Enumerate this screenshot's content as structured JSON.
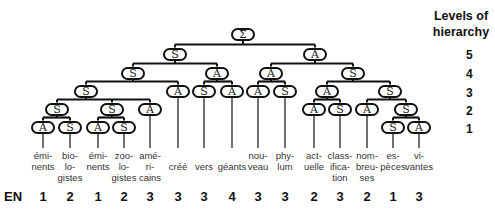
{
  "header": {
    "line1": "Levels of",
    "line2": "hierarchy"
  },
  "levels": [
    {
      "label": "5",
      "y": 48
    },
    {
      "label": "4",
      "y": 67
    },
    {
      "label": "3",
      "y": 86
    },
    {
      "label": "2",
      "y": 104
    },
    {
      "label": "1",
      "y": 122
    }
  ],
  "en_label": "EN",
  "nodes": [
    {
      "id": "root",
      "label": "Σ",
      "x": 243,
      "y": 34,
      "parent": null
    },
    {
      "id": "s5",
      "label": "S",
      "x": 175,
      "y": 54,
      "parent": "root"
    },
    {
      "id": "a5",
      "label": "A",
      "x": 315,
      "y": 54,
      "parent": "root"
    },
    {
      "id": "s4",
      "label": "S",
      "x": 133,
      "y": 73,
      "parent": "s5"
    },
    {
      "id": "a4a",
      "label": "A",
      "x": 217,
      "y": 73,
      "parent": "s5"
    },
    {
      "id": "a4b",
      "label": "A",
      "x": 271,
      "y": 73,
      "parent": "a5"
    },
    {
      "id": "s4b",
      "label": "S",
      "x": 353,
      "y": 73,
      "parent": "a5"
    },
    {
      "id": "s3",
      "label": "S",
      "x": 86,
      "y": 91,
      "parent": "s4"
    },
    {
      "id": "a3_cree",
      "label": "A",
      "x": 178,
      "y": 91,
      "parent": "s4"
    },
    {
      "id": "s3_vers",
      "label": "S",
      "x": 204,
      "y": 91,
      "parent": "a4a"
    },
    {
      "id": "a3_geants",
      "label": "A",
      "x": 232,
      "y": 91,
      "parent": "a4a"
    },
    {
      "id": "a3_nouveau",
      "label": "A",
      "x": 258,
      "y": 91,
      "parent": "a4b"
    },
    {
      "id": "s3_phylum",
      "label": "S",
      "x": 285,
      "y": 91,
      "parent": "a4b"
    },
    {
      "id": "a3",
      "label": "A",
      "x": 327,
      "y": 91,
      "parent": "s4b"
    },
    {
      "id": "s3b",
      "label": "S",
      "x": 390,
      "y": 91,
      "parent": "s4b"
    },
    {
      "id": "s2a",
      "label": "S",
      "x": 57,
      "y": 109,
      "parent": "s3"
    },
    {
      "id": "s2b",
      "label": "S",
      "x": 112,
      "y": 109,
      "parent": "s3"
    },
    {
      "id": "a2_americains",
      "label": "A",
      "x": 150,
      "y": 109,
      "parent": "s3"
    },
    {
      "id": "a2_actuelle",
      "label": "A",
      "x": 314,
      "y": 109,
      "parent": "a3"
    },
    {
      "id": "s2_classification",
      "label": "S",
      "x": 340,
      "y": 109,
      "parent": "a3"
    },
    {
      "id": "a2_nombreuses",
      "label": "A",
      "x": 367,
      "y": 109,
      "parent": "s3b"
    },
    {
      "id": "s2c",
      "label": "S",
      "x": 406,
      "y": 109,
      "parent": "s3b"
    },
    {
      "id": "a1_em1",
      "label": "A",
      "x": 43,
      "y": 127,
      "parent": "s2a"
    },
    {
      "id": "s1_bio",
      "label": "S",
      "x": 70,
      "y": 127,
      "parent": "s2a"
    },
    {
      "id": "a1_em2",
      "label": "A",
      "x": 98,
      "y": 127,
      "parent": "s2b"
    },
    {
      "id": "s1_zoo",
      "label": "S",
      "x": 124,
      "y": 127,
      "parent": "s2b"
    },
    {
      "id": "s1_especes",
      "label": "S",
      "x": 393,
      "y": 127,
      "parent": "s2c"
    },
    {
      "id": "a1_vivantes",
      "label": "A",
      "x": 419,
      "y": 127,
      "parent": "s2c"
    }
  ],
  "words": [
    {
      "lines": [
        "émi-",
        "nents"
      ],
      "x": 43,
      "leaf": "a1_em1",
      "en": "1"
    },
    {
      "lines": [
        "bio-",
        "lo-",
        "gistes"
      ],
      "x": 70,
      "leaf": "s1_bio",
      "en": "2"
    },
    {
      "lines": [
        "émi-",
        "nents"
      ],
      "x": 98,
      "leaf": "a1_em2",
      "en": "1"
    },
    {
      "lines": [
        "zoo-",
        "lo-",
        "gistes"
      ],
      "x": 124,
      "leaf": "s1_zoo",
      "en": "2"
    },
    {
      "lines": [
        "amé-",
        "ri-",
        "cains"
      ],
      "x": 150,
      "leaf": "a2_americains",
      "en": "3"
    },
    {
      "lines": [
        "",
        "créé"
      ],
      "x": 178,
      "leaf": "a3_cree",
      "en": "3"
    },
    {
      "lines": [
        "",
        "vers"
      ],
      "x": 204,
      "leaf": "s3_vers",
      "en": "3"
    },
    {
      "lines": [
        "",
        "géants"
      ],
      "x": 232,
      "leaf": "a3_geants",
      "en": "4"
    },
    {
      "lines": [
        "nou-",
        "veau"
      ],
      "x": 258,
      "leaf": "a3_nouveau",
      "en": "3"
    },
    {
      "lines": [
        "phy-",
        "lum"
      ],
      "x": 285,
      "leaf": "s3_phylum",
      "en": "3"
    },
    {
      "lines": [
        "act-",
        "uelle"
      ],
      "x": 314,
      "leaf": "a2_actuelle",
      "en": "2"
    },
    {
      "lines": [
        "class-",
        "ifica-",
        "tion"
      ],
      "x": 340,
      "leaf": "s2_classification",
      "en": "3"
    },
    {
      "lines": [
        "nom-",
        "breu-",
        "ses"
      ],
      "x": 367,
      "leaf": "a2_nombreuses",
      "en": "2"
    },
    {
      "lines": [
        "es-",
        "pèces"
      ],
      "x": 393,
      "leaf": "s1_especes",
      "en": "1"
    },
    {
      "lines": [
        "vi-",
        "vantes"
      ],
      "x": 419,
      "leaf": "a1_vivantes",
      "en": "3"
    }
  ],
  "colors": {
    "line": "#111111",
    "text": "#333333"
  }
}
